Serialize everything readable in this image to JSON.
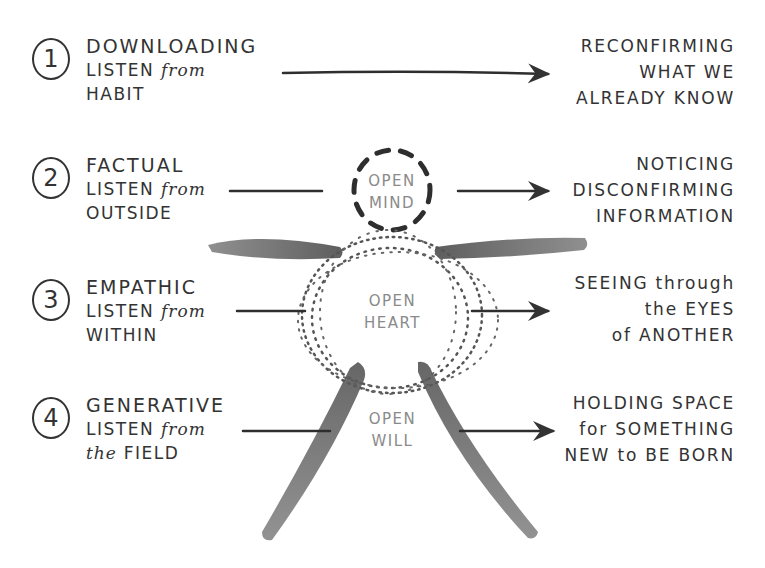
{
  "diagram": {
    "levels": [
      {
        "number": "1",
        "title": "DOWNLOADING",
        "listen_prefix": "LISTEN",
        "listen_from": "from",
        "source": "HABIT",
        "result": [
          "RECONFIRMING",
          "WHAT WE",
          "ALREADY KNOW"
        ]
      },
      {
        "number": "2",
        "title": "FACTUAL",
        "listen_prefix": "LISTEN",
        "listen_from": "from",
        "source": "OUTSIDE",
        "result": [
          "NOTICING",
          "DISCONFIRMING",
          "INFORMATION"
        ]
      },
      {
        "number": "3",
        "title": "EMPATHIC",
        "listen_prefix": "LISTEN",
        "listen_from": "from",
        "source": "WITHIN",
        "result": [
          "SEEING through",
          "the EYES",
          "of ANOTHER"
        ]
      },
      {
        "number": "4",
        "title": "GENERATIVE",
        "listen_prefix": "LISTEN",
        "listen_from": "from",
        "source_prefix": "the",
        "source": "FIELD",
        "result": [
          "HOLDING SPACE",
          "for SOMETHING",
          "NEW to BE BORN"
        ]
      }
    ],
    "center": {
      "mind": [
        "OPEN",
        "MIND"
      ],
      "heart": [
        "OPEN",
        "HEART"
      ],
      "will": [
        "OPEN",
        "WILL"
      ]
    },
    "colors": {
      "ink": "#333333",
      "figure": "#5a5a5a",
      "center_text": "#8a8a8a",
      "background": "#ffffff"
    }
  }
}
